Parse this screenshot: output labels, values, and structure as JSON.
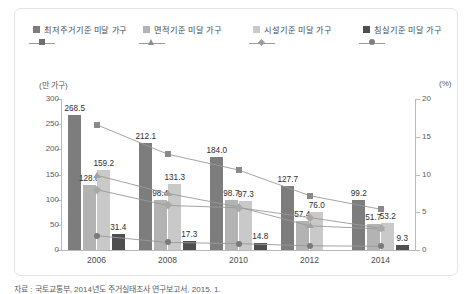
{
  "legend": {
    "items": [
      {
        "label": "최저주거기준 미달 가구",
        "marker": "sq",
        "color": "#7d7d7d"
      },
      {
        "label": "면적기준 미달 가구",
        "marker": "tri",
        "color": "#b3b3b3"
      },
      {
        "label": "시설기준 미달 가구",
        "marker": "dia",
        "color": "#c9c9c9"
      },
      {
        "label": "침실기준 미달 가구",
        "marker": "cir",
        "color": "#4f4f4f"
      }
    ]
  },
  "caption": "자료 : 국토교통부, 2014년도 주거실태조사 연구보고서, 2015. 1.",
  "chart_data": {
    "type": "bar",
    "title": "",
    "xlabel": "",
    "ylabel": "만 가구",
    "y2label": "%",
    "left_axis_caption": "(만 가구)",
    "right_axis_caption": "(%)",
    "categories": [
      "2006",
      "2008",
      "2010",
      "2012",
      "2014"
    ],
    "ylim": [
      0,
      300
    ],
    "yticks": [
      0,
      50,
      100,
      150,
      200,
      250,
      300
    ],
    "y2lim": [
      0,
      20
    ],
    "y2ticks": [
      0,
      5,
      10,
      15,
      20
    ],
    "grid": false,
    "legend_position": "top",
    "series": [
      {
        "name": "최저주거기준 미달 가구",
        "type": "bar",
        "axis": "left",
        "color": "#7d7d7d",
        "values": [
          268.5,
          212.1,
          184.0,
          127.7,
          99.2
        ],
        "labels": [
          "268.5",
          "212.1",
          "184.0",
          "127.7",
          "99.2"
        ]
      },
      {
        "name": "면적기준 미달 가구",
        "type": "bar",
        "axis": "left",
        "color": "#b3b3b3",
        "values": [
          128.8,
          98.4,
          98.7,
          57.4,
          51.7
        ],
        "labels": [
          "128.8",
          "98.4",
          "98.7",
          "57.4",
          "51.7"
        ]
      },
      {
        "name": "시설기준 미달 가구",
        "type": "bar",
        "axis": "left",
        "color": "#c9c9c9",
        "values": [
          159.2,
          131.3,
          97.3,
          76.0,
          53.2
        ],
        "labels": [
          "159.2",
          "131.3",
          "97.3",
          "76.0",
          "53.2"
        ]
      },
      {
        "name": "침실기준 미달 가구",
        "type": "bar",
        "axis": "left",
        "color": "#4f4f4f",
        "values": [
          31.4,
          17.3,
          14.8,
          0,
          9.3
        ],
        "labels": [
          "31.4",
          "17.3",
          "14.8",
          "",
          "9.3"
        ]
      },
      {
        "name": "최저주거기준 미달 가구 비율",
        "type": "line",
        "axis": "right",
        "marker": "sq",
        "color": "#8a8a8a",
        "values": [
          16.6,
          12.7,
          10.6,
          7.2,
          5.4
        ]
      },
      {
        "name": "면적기준 미달 가구 비율",
        "type": "line",
        "axis": "right",
        "marker": "tri",
        "color": "#a3a3a3",
        "values": [
          9.9,
          7.5,
          5.7,
          3.2,
          2.8
        ]
      },
      {
        "name": "시설기준 미달 가구 비율",
        "type": "line",
        "axis": "right",
        "marker": "dia",
        "color": "#a8a8a8",
        "values": [
          8.0,
          5.9,
          5.6,
          4.3,
          2.9
        ]
      },
      {
        "name": "침실기준 미달 가구 비율",
        "type": "line",
        "axis": "right",
        "marker": "cir",
        "color": "#7a7a7a",
        "values": [
          1.9,
          1.0,
          0.85,
          0.55,
          0.5
        ]
      }
    ]
  }
}
